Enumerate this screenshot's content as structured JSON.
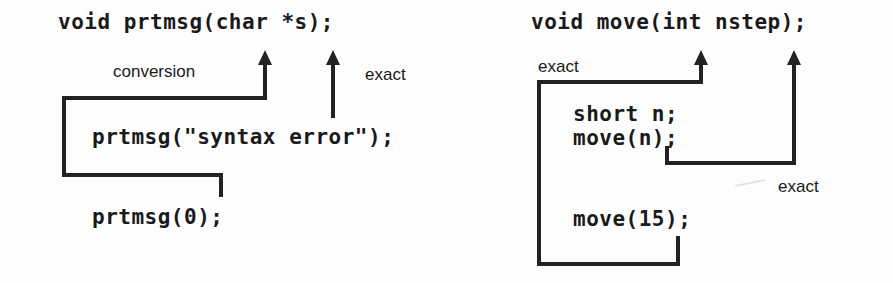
{
  "figure": {
    "background_color": "#fdfdfd",
    "ink_color": "#222222"
  },
  "left_diagram": {
    "name": "prtmsg-example",
    "prototype": "void prtmsg(char *s);",
    "calls": [
      "prtmsg(\"syntax error\");",
      "prtmsg(0);"
    ],
    "annotations": [
      {
        "text": "conversion",
        "describes": "prtmsg(0) to char *s"
      },
      {
        "text": "exact",
        "describes": "prtmsg(\"syntax error\") to char *s"
      }
    ]
  },
  "right_diagram": {
    "name": "move-example",
    "prototype": "void move(int nstep);",
    "calls": [
      "short n;",
      "move(n);",
      "move(15);"
    ],
    "annotations": [
      {
        "text": "exact",
        "describes": "move(15) to int nstep"
      },
      {
        "text": "exact",
        "describes": "move(n) to int nstep"
      }
    ]
  }
}
